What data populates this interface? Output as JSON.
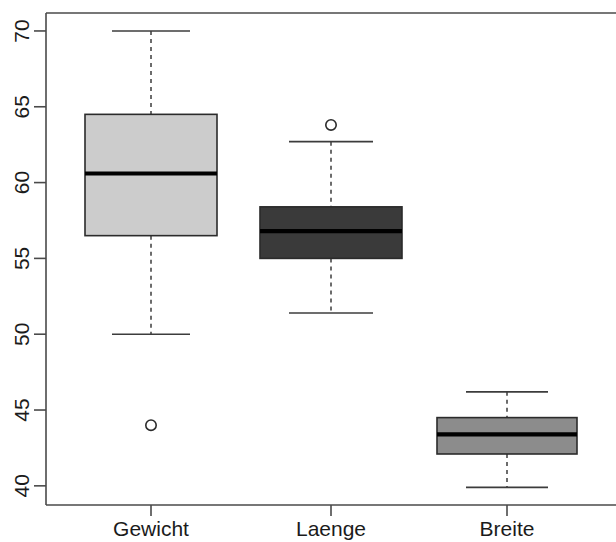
{
  "chart_data": {
    "type": "box",
    "title": "",
    "xlabel": "",
    "ylabel": "",
    "categories": [
      "Gewicht",
      "Laenge",
      "Breite"
    ],
    "ylim": [
      38.8,
      71.2
    ],
    "yticks": [
      40,
      45,
      50,
      55,
      60,
      65,
      70
    ],
    "ytick_labels": [
      "40",
      "45",
      "50",
      "55",
      "60",
      "65",
      "70"
    ],
    "grid": false,
    "legend": "none",
    "orientation": "vertical",
    "axis_label_rotation_deg": 90,
    "boxes": [
      {
        "name": "Gewicht",
        "fill_color": "#cccccc",
        "lower_whisker": 50.0,
        "q1": 56.5,
        "median": 60.6,
        "q3": 64.5,
        "upper_whisker": 70.0,
        "outliers": [
          44.0
        ]
      },
      {
        "name": "Laenge",
        "fill_color": "#3a3a3a",
        "lower_whisker": 51.4,
        "q1": 55.0,
        "median": 56.8,
        "q3": 58.4,
        "upper_whisker": 62.7,
        "outliers": [
          63.8
        ]
      },
      {
        "name": "Breite",
        "fill_color": "#8c8c8c",
        "lower_whisker": 39.9,
        "q1": 42.1,
        "median": 43.4,
        "q3": 44.5,
        "upper_whisker": 46.2,
        "outliers": []
      }
    ]
  },
  "colors": {
    "background": "#ffffff",
    "axis": "#4a4a4a",
    "box_outline": "#2b2b2b",
    "median": "#000000",
    "whisker": "#3c3c3c",
    "text": "#1b1b1b"
  }
}
